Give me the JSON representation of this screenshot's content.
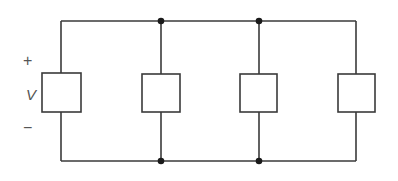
{
  "diagram": {
    "labels": {
      "plus": "+",
      "voltage": "V",
      "minus": "−"
    },
    "colors": {
      "wire": "#3a3a3a",
      "node": "#1a1a1a",
      "label": "#555555",
      "background": "#ffffff"
    },
    "rails": {
      "top_y": 21,
      "bottom_y": 161,
      "left_x": 61,
      "right_x": 356
    },
    "elements": [
      {
        "id": "source",
        "x": 61,
        "box": [
          42,
          73,
          39,
          39
        ]
      },
      {
        "id": "load-1",
        "x": 161,
        "box": [
          142,
          74,
          38,
          38
        ]
      },
      {
        "id": "load-2",
        "x": 259,
        "box": [
          240,
          74,
          37,
          38
        ]
      },
      {
        "id": "load-3",
        "x": 356,
        "box": [
          338,
          74,
          37,
          38
        ]
      }
    ],
    "nodes": [
      {
        "x": 161,
        "y": 21
      },
      {
        "x": 259,
        "y": 21
      },
      {
        "x": 161,
        "y": 161
      },
      {
        "x": 259,
        "y": 161
      }
    ]
  }
}
